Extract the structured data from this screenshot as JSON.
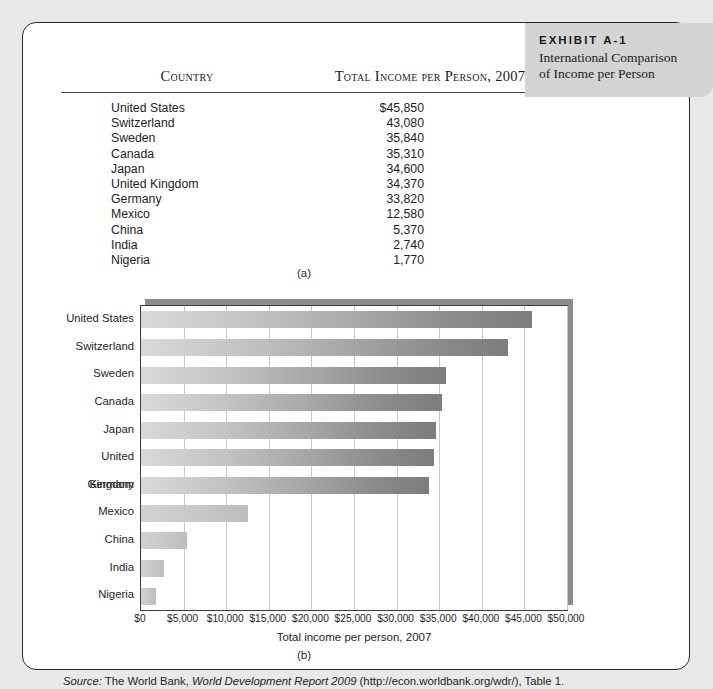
{
  "exhibit": {
    "kicker": "EXHIBIT A-1",
    "title_line1": "International Comparison",
    "title_line2": "of Income per Person"
  },
  "table": {
    "headers": [
      "Country",
      "Total Income per Person, 2007"
    ],
    "rows": [
      {
        "country": "United States",
        "value": "$45,850"
      },
      {
        "country": "Switzerland",
        "value": "43,080"
      },
      {
        "country": "Sweden",
        "value": "35,840"
      },
      {
        "country": "Canada",
        "value": "35,310"
      },
      {
        "country": "Japan",
        "value": "34,600"
      },
      {
        "country": "United Kingdom",
        "value": "34,370"
      },
      {
        "country": "Germany",
        "value": "33,820"
      },
      {
        "country": "Mexico",
        "value": "12,580"
      },
      {
        "country": "China",
        "value": "5,370"
      },
      {
        "country": "India",
        "value": "2,740"
      },
      {
        "country": "Nigeria",
        "value": "1,770"
      }
    ]
  },
  "sublabel_a": "(a)",
  "sublabel_b": "(b)",
  "chart_data": {
    "type": "bar",
    "orientation": "horizontal",
    "title": "",
    "xlabel": "Total income per person, 2007",
    "ylabel": "",
    "categories": [
      "United States",
      "Switzerland",
      "Sweden",
      "Canada",
      "Japan",
      "United Kingdom",
      "Germany",
      "Mexico",
      "China",
      "India",
      "Nigeria"
    ],
    "values": [
      45850,
      43080,
      35840,
      35310,
      34600,
      34370,
      33820,
      12580,
      5370,
      2740,
      1770
    ],
    "xlim": [
      0,
      50000
    ],
    "xticks": [
      0,
      5000,
      10000,
      15000,
      20000,
      25000,
      30000,
      35000,
      40000,
      45000,
      50000
    ],
    "xticklabels": [
      "$0",
      "$5,000",
      "$10,000",
      "$15,000",
      "$20,000",
      "$25,000",
      "$30,000",
      "$35,000",
      "$40,000",
      "$45,000",
      "$50,000"
    ],
    "grid": "vertical",
    "legend": "none",
    "bar_color_light": "#d9d9d9",
    "bar_color_dark": "#7d7d7d"
  },
  "source": {
    "prefix": "Source:",
    "publisher": " The World Bank, ",
    "report": "World Development Report 2009",
    "suffix": " (http://econ.worldbank.org/wdr/), Table 1."
  }
}
